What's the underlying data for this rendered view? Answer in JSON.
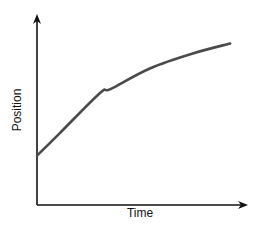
{
  "chart_data": {
    "type": "line",
    "title": "",
    "xlabel": "Time",
    "ylabel": "Position",
    "x_ticks": [],
    "y_ticks": [],
    "grid": false,
    "legend": null,
    "qualitative": true,
    "series": [
      {
        "name": "position",
        "color": "#4a4a4a",
        "x": [
          0,
          0.11,
          0.3,
          0.35,
          0.54,
          0.75,
          0.92
        ],
        "y": [
          0.26,
          0.38,
          0.59,
          0.61,
          0.72,
          0.8,
          0.85
        ]
      }
    ],
    "xlim": [
      0,
      1
    ],
    "ylim": [
      0,
      1
    ]
  },
  "colors": {
    "axis": "#111111",
    "curve": "#4a4a4a",
    "background": "#ffffff"
  }
}
